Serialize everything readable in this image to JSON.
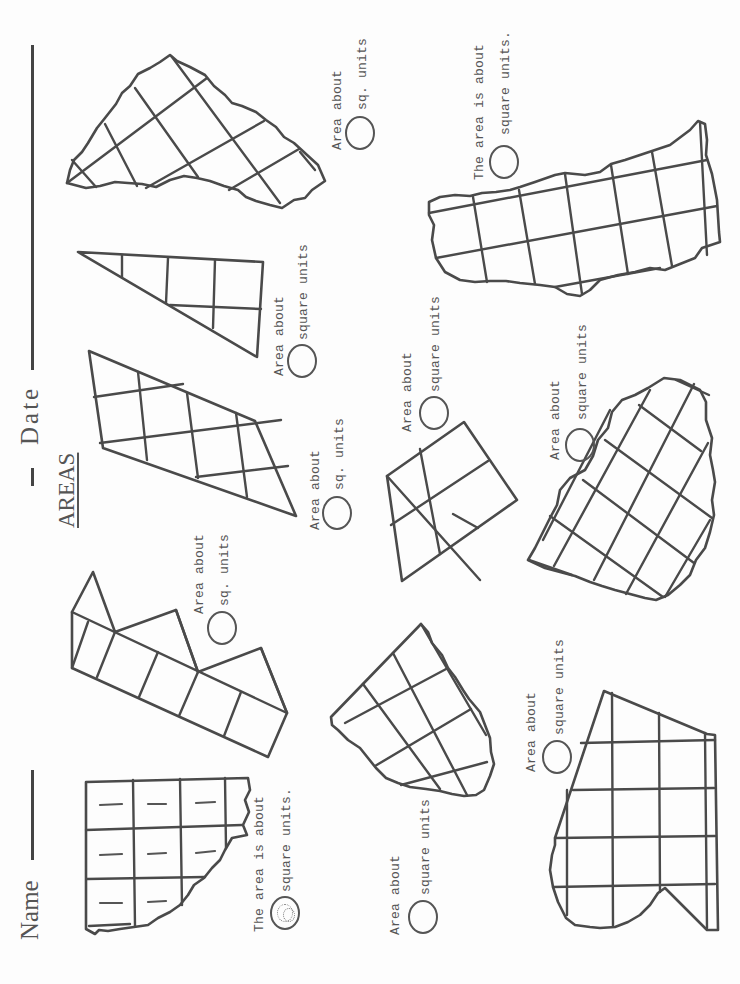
{
  "worksheet": {
    "title": "AREAS",
    "name_label": "Name",
    "date_label": "Date",
    "orientation": "rotated 90deg counter-clockwise"
  },
  "questions": [
    {
      "id": 1,
      "line1": "The area is about",
      "line2": "square units.",
      "answer": "8",
      "shape": "3x3 grid with torn lower-right corner, 8 cells tallied"
    },
    {
      "id": 2,
      "line1": "Area about",
      "line2": "sq. units",
      "answer": "",
      "shape": "row of squares with triangles"
    },
    {
      "id": 3,
      "line1": "Area about",
      "line2": "sq. units",
      "answer": "",
      "shape": "parallelogram on grid"
    },
    {
      "id": 4,
      "line1": "Area about",
      "line2": "square units",
      "answer": "",
      "shape": "right triangle on grid"
    },
    {
      "id": 5,
      "line1": "Area about",
      "line2": "sq. units",
      "answer": "",
      "shape": "torn triangular shape on grid"
    },
    {
      "id": 6,
      "line1": "Area about",
      "line2": "square units",
      "answer": "",
      "shape": "torn shape on diagonal grid"
    },
    {
      "id": 7,
      "line1": "Area about",
      "line2": "square units",
      "answer": "",
      "shape": "trapezoid 2x2 grid"
    },
    {
      "id": 8,
      "line1": "The area is about",
      "line2": "square units.",
      "answer": "",
      "shape": "torn rectangle 6x2 grid"
    },
    {
      "id": 9,
      "line1": "Area about",
      "line2": "square units",
      "answer": "",
      "shape": "torn oval on diagonal grid"
    },
    {
      "id": 10,
      "line1": "Area about",
      "line2": "square units",
      "answer": "",
      "shape": "irregular polygon on grid"
    }
  ],
  "colors": {
    "ink": "#4a4a4a",
    "paper": "#fdfdfd"
  }
}
